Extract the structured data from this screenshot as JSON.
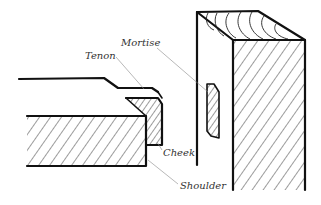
{
  "diagram": {
    "labels": {
      "mortise": "Mortise",
      "tenon": "Tenon",
      "cheek": "Cheek",
      "shoulder": "Shoulder"
    },
    "colors": {
      "line": "#111111",
      "leader": "#888888",
      "label_text": "#333333",
      "background": "#ffffff"
    }
  }
}
